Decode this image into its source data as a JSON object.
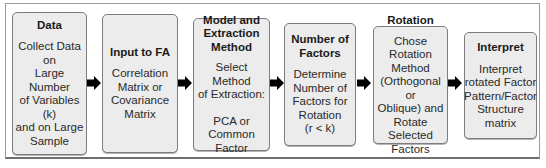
{
  "diagram": {
    "type": "flowchart",
    "direction": "left-to-right",
    "steps": [
      {
        "title": "Data",
        "description": "Collect Data on\nLarge Number\nof Variables (k)\nand on Large\nSample",
        "extra": ""
      },
      {
        "title": "Input to FA",
        "description": "Correlation\nMatrix or\nCovariance\nMatrix",
        "extra": ""
      },
      {
        "title": "Model and\nExtraction\nMethod",
        "description": "Select Method\nof Extraction:",
        "extra": "PCA or\nCommon\nFactor"
      },
      {
        "title": "Number of\nFactors",
        "description": "Determine\nNumber of\nFactors for\nRotation\n(r < k)",
        "extra": ""
      },
      {
        "title": "Rotation",
        "description": "Chose Rotation\nMethod\n(Orthogonal or\nOblique) and\nRotate\nSelected\nFactors",
        "extra": ""
      },
      {
        "title": "Interpret",
        "description": "Interpret\nrotated Factor\nPattern/Factor\nStructure\nmatrix",
        "extra": ""
      }
    ],
    "connectors": [
      {
        "from": 0,
        "to": 1,
        "icon": "arrow-right-icon"
      },
      {
        "from": 1,
        "to": 2,
        "icon": "arrow-right-icon"
      },
      {
        "from": 2,
        "to": 3,
        "icon": "arrow-right-icon"
      },
      {
        "from": 3,
        "to": 4,
        "icon": "arrow-right-icon"
      },
      {
        "from": 4,
        "to": 5,
        "icon": "arrow-right-icon"
      }
    ],
    "colors": {
      "box_fill": "#ececec",
      "box_border": "#7d7d7d",
      "arrow": "#000000",
      "frame_border": "#9a9a9a"
    }
  }
}
